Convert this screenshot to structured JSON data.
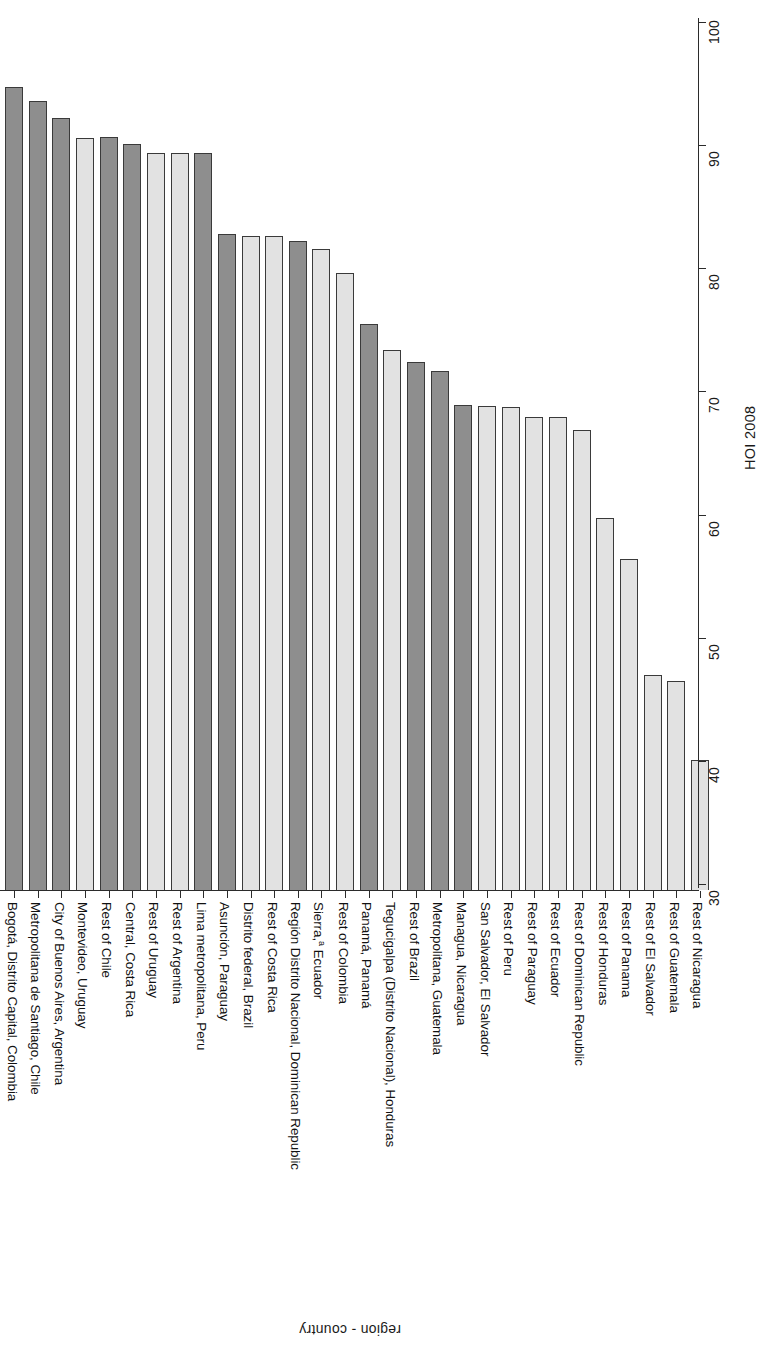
{
  "chart_data": {
    "type": "bar",
    "title": "",
    "subtitle": "",
    "orientation": "vertical-bars-rotated-labels",
    "xlabel": "region - country",
    "ylabel": "HOI 2008",
    "ylim": [
      30,
      100
    ],
    "yticks": [
      30,
      40,
      50,
      60,
      70,
      80,
      90,
      100
    ],
    "grid": false,
    "legend": null,
    "annotations": [
      "a"
    ],
    "series_name": "HOI 2008",
    "colors": {
      "dark": "#8e8e8e",
      "light": "#e2e2e2",
      "outline": "#3a3a3a",
      "axis": "#2b2b2b",
      "background": "#ffffff"
    },
    "categories": [
      "Bogotá, Distrito Capital, Colombia",
      "Metropolitana de Santiago, Chile",
      "City of Buenos Aires, Argentina",
      "Montevideo, Uruguay",
      "Rest of Chile",
      "Central, Costa Rica",
      "Rest of Uruguay",
      "Rest of Argentina",
      "Lima metropolitana, Peru",
      "Asunción, Paraguay",
      "Distrito federal, Brazil",
      "Rest of Costa Rica",
      "Región Distrito Nacional, Dominican Republic",
      "Sierra,ᵃ Ecuador",
      "Rest of Colombia",
      "Panamá, Panamá",
      "Tegucigalpa (Distrito Nacional), Honduras",
      "Rest of Brazil",
      "Metropolitana, Guatemala",
      "Managua, Nicaragua",
      "San Salvador, El Salvador",
      "Rest of Peru",
      "Rest of Paraguay",
      "Rest of Ecuador",
      "Rest of Dominican Republic",
      "Rest of Honduras",
      "Rest of Panama",
      "Rest of El Salvador",
      "Rest of Guatemala",
      "Rest of Nicaragua"
    ],
    "values": [
      94.7,
      93.6,
      92.2,
      90.6,
      90.7,
      90.1,
      89.4,
      89.4,
      89.4,
      82.8,
      82.6,
      82.6,
      82.2,
      81.6,
      79.6,
      75.5,
      73.4,
      72.4,
      71.7,
      68.9,
      68.8,
      68.7,
      67.9,
      67.9,
      66.9,
      59.7,
      56.4,
      47.0,
      46.5,
      40.1
    ],
    "shades": [
      "dark",
      "dark",
      "dark",
      "light",
      "dark",
      "dark",
      "light",
      "light",
      "dark",
      "dark",
      "light",
      "light",
      "dark",
      "light",
      "light",
      "dark",
      "light",
      "dark",
      "dark",
      "dark",
      "light",
      "light",
      "light",
      "light",
      "light",
      "light",
      "light",
      "light",
      "light",
      "light"
    ],
    "bar_labels": [
      "Bogotá, Distrito Capital, Colombia",
      "Metropolitana de Santiago, Chile",
      "City of Buenos Aires, Argentina",
      "Montevideo, Uruguay",
      "Rest of Chile",
      "Central, Costa Rica",
      "Rest of Uruguay",
      "Rest of Argentina",
      "Lima metropolitana, Peru",
      "Asunción, Paraguay",
      "Distrito federal, Brazil",
      "Rest of Costa Rica",
      "Región Distrito Nacional, Dominican Republic",
      "Sierra, Ecuador",
      "Rest of Colombia",
      "Panamá, Panamá",
      "Tegucigalpa (Distrito Nacional), Honduras",
      "Rest of Brazil",
      "Metropolitana, Guatemala",
      "Managua, Nicaragua",
      "San Salvador, El Salvador",
      "Rest of Peru",
      "Rest of Paraguay",
      "Rest of Ecuador",
      "Rest of Dominican Republic",
      "Rest of Honduras",
      "Rest of Panama",
      "Rest of El Salvador",
      "Rest of Guatemala",
      "Rest of Nicaragua"
    ]
  },
  "axes": {
    "value_axis_title": "HOI 2008",
    "category_axis_title": "region - country",
    "tick_labels": [
      "30",
      "40",
      "50",
      "60",
      "70",
      "80",
      "90",
      "100"
    ]
  },
  "footnote_marker": "a"
}
